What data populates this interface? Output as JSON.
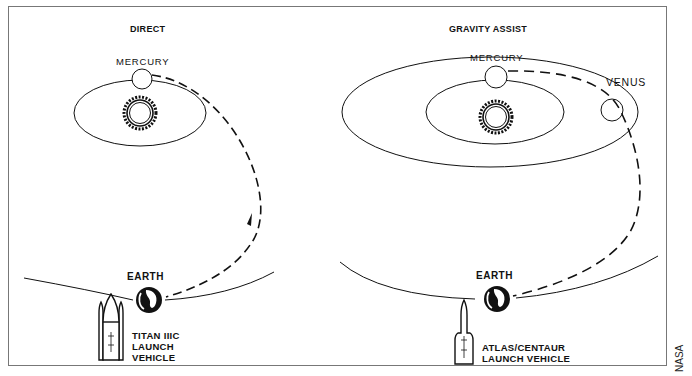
{
  "panels": {
    "direct": {
      "title": "DIRECT",
      "mercury_label": "MERCURY",
      "earth_label": "EARTH",
      "vehicle_lines": [
        "TITAN IIIC",
        "LAUNCH",
        "VEHICLE"
      ]
    },
    "gravity_assist": {
      "title": "GRAVITY ASSIST",
      "mercury_label": "MERCURY",
      "venus_label": "VENUS",
      "earth_label": "EARTH",
      "vehicle_lines": [
        "ATLAS/CENTAUR",
        "LAUNCH VEHICLE"
      ]
    }
  },
  "credit": "NASA",
  "icons": {
    "sun": "sun-icon",
    "earth": "globe-icon",
    "rocket": "rocket-icon"
  },
  "colors": {
    "line": "#111111",
    "background": "#ffffff",
    "frame": "#777777"
  }
}
